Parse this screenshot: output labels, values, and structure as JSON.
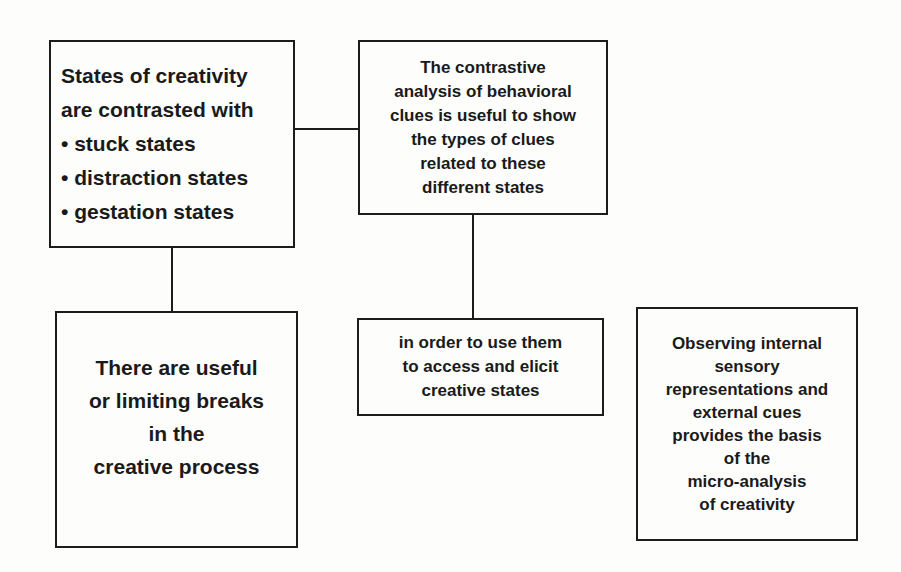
{
  "diagram": {
    "box1": {
      "lines": [
        "States of creativity",
        "are contrasted with"
      ],
      "bullets": [
        "stuck states",
        "distraction states",
        "gestation states"
      ]
    },
    "box2": {
      "lines": [
        "The contrastive",
        "analysis of behavioral",
        "clues is useful to show",
        "the types of clues",
        "related to these",
        "different states"
      ]
    },
    "box3": {
      "lines": [
        "There are useful",
        "or limiting breaks",
        "in the",
        "creative process"
      ]
    },
    "box4": {
      "lines": [
        "in order to use them",
        "to access and elicit",
        "creative states"
      ]
    },
    "box5": {
      "lines": [
        "Observing internal",
        "sensory",
        "representations and",
        "external cues",
        "provides the basis",
        "of the",
        "micro-analysis",
        "of creativity"
      ]
    },
    "connections": [
      {
        "from": "box1",
        "to": "box2"
      },
      {
        "from": "box1",
        "to": "box3"
      },
      {
        "from": "box2",
        "to": "box4"
      }
    ]
  }
}
